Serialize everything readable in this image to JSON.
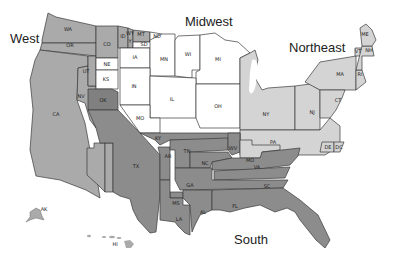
{
  "colors": {
    "west": "#aaaaaa",
    "midwest": "#ffffff",
    "northeast": "#d4d4d4",
    "south": "#8c8c8c",
    "oklahoma": "#808080",
    "border": "#3a3a3a"
  },
  "regions": {
    "west": "West",
    "midwest": "Midwest",
    "northeast": "Northeast",
    "south": "South"
  },
  "states": {
    "WA": "WA",
    "OR": "OR",
    "CA": "CA",
    "NV": "NV",
    "UT": "UT",
    "AZ": "AZ",
    "NM": "NM",
    "CO": "CO",
    "ID": "ID",
    "WY": "WY",
    "Y": "Y",
    "MT": "MT",
    "ND": "ND",
    "SD": "SD",
    "NE": "NE",
    "KS": "KS",
    "OK": "OK",
    "IA": "IA",
    "MN": "MN",
    "WI": "WI",
    "MI": "MI",
    "IN": "IN",
    "IL": "IL",
    "OH": "OH",
    "MO": "MO",
    "NY": "NY",
    "NJ": "NJ",
    "PA": "PA",
    "CT": "CT",
    "MA": "MA",
    "ME": "ME",
    "VT": "VT",
    "NH": "NH",
    "RI": "RI",
    "DE": "DE",
    "DC": "DC",
    "MD": "MO",
    "TX": "TX",
    "AR": "AR",
    "KY": "KY",
    "TN": "TN",
    "WV": "WV",
    "NC": "NC",
    "VA": "VA",
    "SC": "SC",
    "GA": "GA",
    "MS": "MS",
    "AL": "AL",
    "LA": "LA",
    "FL": "FL",
    "AK": "AK",
    "HI": "HI"
  }
}
